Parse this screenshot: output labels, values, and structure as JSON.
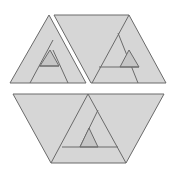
{
  "diagram": {
    "colors": {
      "background": "#ffffff",
      "piece_fill": "#d6d6d6",
      "inner_fill": "#c6c6c6",
      "stroke": "#6a6a6a"
    },
    "pieces": [
      {
        "name": "top-left-triangle",
        "shape": "triangle"
      },
      {
        "name": "top-right-parallelogram",
        "shape": "parallelogram"
      },
      {
        "name": "bottom-trapezoid",
        "shape": "trapezoid"
      }
    ]
  }
}
